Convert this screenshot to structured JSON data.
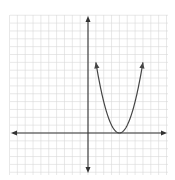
{
  "chart_data": {
    "type": "line",
    "title": "",
    "xlabel": "",
    "ylabel": "",
    "xlim": [
      -10,
      10
    ],
    "ylim": [
      -5,
      15
    ],
    "grid": true,
    "legend": null,
    "series": [
      {
        "name": "parabola",
        "equation": "y = (x - 4)^2",
        "vertex": [
          4,
          0
        ],
        "x": [
          1,
          2,
          3,
          4,
          5,
          6,
          7
        ],
        "y": [
          9,
          4,
          1,
          0,
          1,
          4,
          9
        ],
        "arrows_at_ends": true
      }
    ],
    "axes": {
      "x_arrows": true,
      "y_arrows": true,
      "tick_labels": false
    }
  },
  "style": {
    "grid_color": "#d9d9d9",
    "axis_color": "#333333",
    "curve_color": "#444444",
    "background": "#ffffff"
  },
  "layout": {
    "origin_px": [
      88,
      133
    ],
    "unit_px": 7.85,
    "grid_left": 10,
    "grid_right": 168,
    "grid_top": 15,
    "grid_bottom": 175
  }
}
